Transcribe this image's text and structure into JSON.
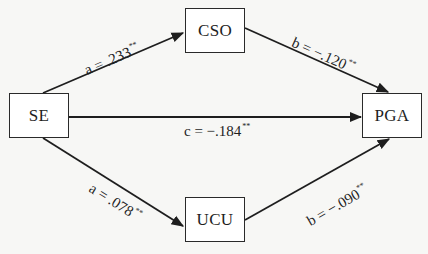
{
  "diagram": {
    "type": "mediation-path-diagram",
    "nodes": {
      "se": {
        "label": "SE"
      },
      "cso": {
        "label": "CSO"
      },
      "ucu": {
        "label": "UCU"
      },
      "pga": {
        "label": "PGA"
      }
    },
    "edges": {
      "se_cso": {
        "from": "SE",
        "to": "CSO",
        "path": "a",
        "value": ".233",
        "sig": "**",
        "text": "a = .233"
      },
      "cso_pga": {
        "from": "CSO",
        "to": "PGA",
        "path": "b",
        "value": "−.120",
        "sig": "**",
        "text": "b = −.120"
      },
      "se_pga": {
        "from": "SE",
        "to": "PGA",
        "path": "c",
        "value": "−.184",
        "sig": "**",
        "text": "c = −.184"
      },
      "se_ucu": {
        "from": "SE",
        "to": "UCU",
        "path": "a",
        "value": ".078",
        "sig": "**",
        "text": "a = .078"
      },
      "ucu_pga": {
        "from": "UCU",
        "to": "PGA",
        "path": "b",
        "value": "−.090",
        "sig": "**",
        "text": "b = −.090"
      }
    },
    "colors": {
      "line": "#1e1e1e",
      "box_border": "#2a2a2a",
      "background": "#f7f7f5"
    }
  }
}
